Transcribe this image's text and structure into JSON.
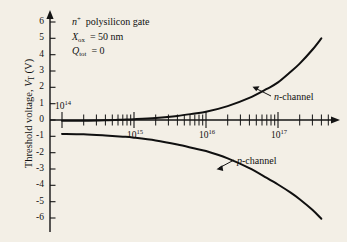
{
  "figure": {
    "background_color": "#f3efe6",
    "ink_color": "#141414"
  },
  "chart_data": {
    "type": "line",
    "title": "",
    "xlabel": "",
    "ylabel": "Threshold voltage, V_T (V)",
    "xscale": "log",
    "xlim": [
      75000000000000.0,
      5e+17
    ],
    "ylim": [
      -6.5,
      6.5
    ],
    "grid": false,
    "legend_position": "inline-annotation",
    "x_tick_labels": [
      "10^14",
      "10^15",
      "10^16",
      "10^17"
    ],
    "x_tick_values": [
      100000000000000.0,
      1000000000000000.0,
      1e+16,
      1e+17
    ],
    "y_tick_labels": [
      "6",
      "5",
      "4",
      "3",
      "2",
      "1",
      "0",
      "-1",
      "-2",
      "-3",
      "-4",
      "-5",
      "-6"
    ],
    "y_tick_values": [
      6,
      5,
      4,
      3,
      2,
      1,
      0,
      -1,
      -2,
      -3,
      -4,
      -5,
      -6
    ],
    "series": [
      {
        "name": "n-channel",
        "x": [
          100000000000000.0,
          200000000000000.0,
          400000000000000.0,
          700000000000000.0,
          1000000000000000.0,
          2000000000000000.0,
          4000000000000000.0,
          7000000000000000.0,
          1e+16,
          2e+16,
          4e+16,
          7e+16,
          1e+17,
          1.5e+17,
          2e+17,
          3e+17,
          4e+17
        ],
        "y": [
          -0.05,
          -0.05,
          -0.02,
          0.02,
          0.05,
          0.13,
          0.25,
          0.4,
          0.5,
          0.85,
          1.35,
          1.9,
          2.3,
          2.95,
          3.45,
          4.3,
          5.0
        ]
      },
      {
        "name": "p-channel",
        "x": [
          100000000000000.0,
          200000000000000.0,
          400000000000000.0,
          700000000000000.0,
          1000000000000000.0,
          2000000000000000.0,
          4000000000000000.0,
          7000000000000000.0,
          1e+16,
          2e+16,
          4e+16,
          7e+16,
          1e+17,
          1.5e+17,
          2e+17,
          3e+17,
          4e+17
        ],
        "y": [
          -0.85,
          -0.88,
          -0.95,
          -1.02,
          -1.08,
          -1.25,
          -1.5,
          -1.75,
          -1.9,
          -2.35,
          -2.95,
          -3.55,
          -3.95,
          -4.45,
          -4.85,
          -5.5,
          -6.05
        ]
      }
    ],
    "annotations": [
      "n+ polysilicon gate",
      "Xox = 50 nm",
      "Qtot = 0"
    ]
  },
  "y_axis": {
    "title_main": "Threshold voltage,",
    "title_symbol": "V",
    "title_sub": "T",
    "title_unit": "(V)",
    "ticks": [
      {
        "label": "6",
        "value": 6
      },
      {
        "label": "5",
        "value": 5
      },
      {
        "label": "4",
        "value": 4
      },
      {
        "label": "3",
        "value": 3
      },
      {
        "label": "2",
        "value": 2
      },
      {
        "label": "1",
        "value": 1
      },
      {
        "label": "0",
        "value": 0
      },
      {
        "label": "-1",
        "value": -1
      },
      {
        "label": "-2",
        "value": -2
      },
      {
        "label": "-3",
        "value": -3
      },
      {
        "label": "-4",
        "value": -4
      },
      {
        "label": "-5",
        "value": -5
      },
      {
        "label": "-6",
        "value": -6
      }
    ]
  },
  "x_axis": {
    "ticks": [
      {
        "mantissa": "10",
        "exponent": "14"
      },
      {
        "mantissa": "10",
        "exponent": "15"
      },
      {
        "mantissa": "10",
        "exponent": "16"
      },
      {
        "mantissa": "10",
        "exponent": "17"
      }
    ]
  },
  "annotations": {
    "line1_symbol": "n",
    "line1_sup": "+",
    "line1_rest": "polysilicon gate",
    "line2_symbol": "X",
    "line2_sub": "ox",
    "line2_rest": "= 50 nm",
    "line3_symbol": "Q",
    "line3_sub": "tot",
    "line3_rest": "= 0"
  },
  "series_labels": {
    "n_channel_italic": "n",
    "n_channel_rest": "-channel",
    "p_channel_italic": "p",
    "p_channel_rest": "-channel"
  }
}
